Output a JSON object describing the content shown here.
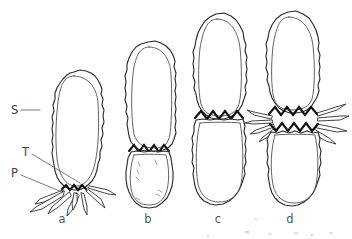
{
  "figure": {
    "background_color": "#ffffff",
    "ink_color": "#2b2b2b",
    "accent_color": "#111111"
  },
  "callouts": [
    {
      "key": "S",
      "label": "S",
      "meaning": "sheath-outer-wavy-wall",
      "x": 11,
      "y": 114,
      "leader": "M 21 110 L 40 110"
    },
    {
      "key": "T",
      "label": "T",
      "meaning": "inner-membrane-theca",
      "x": 22,
      "y": 156,
      "leader": "M 32 154 L 80 183"
    },
    {
      "key": "P",
      "label": "P",
      "meaning": "pseudopodia-spines",
      "x": 11,
      "y": 177,
      "leader": "M 21 175 L 62 192"
    }
  ],
  "panels": [
    {
      "key": "a",
      "label": "a",
      "label_x": 62,
      "label_y": 223,
      "description": "single pear-shaped cell with basal crown of spines",
      "lobes": 1,
      "has_spines": true,
      "has_isthmus": false,
      "isthmus_bands": 0
    },
    {
      "key": "b",
      "label": "b",
      "label_x": 148,
      "label_y": 223,
      "description": "dividing cell, large upper lobe and small lower lobe joined by single zigzag",
      "lobes": 2,
      "has_spines": false,
      "has_isthmus": true,
      "isthmus_bands": 1
    },
    {
      "key": "c",
      "label": "c",
      "label_x": 218,
      "label_y": 223,
      "description": "symmetric dumbbell, two near-equal lobes joined by bold zigzag isthmus",
      "lobes": 2,
      "has_spines": false,
      "has_isthmus": true,
      "isthmus_bands": 1
    },
    {
      "key": "d",
      "label": "d",
      "label_x": 290,
      "label_y": 223,
      "description": "separating daughter cells, double zigzag band with lateral spines",
      "lobes": 2,
      "has_spines": true,
      "has_isthmus": true,
      "isthmus_bands": 2
    }
  ]
}
